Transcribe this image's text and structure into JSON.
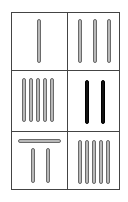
{
  "puzzle": {
    "layout": {
      "rows": 3,
      "cols": 2
    },
    "colors": {
      "border": "#444444",
      "stick_fill": "#b8b8b8",
      "stick_outline": "#6a6a6a",
      "stick_dark": "#111111"
    },
    "cells": [
      {
        "id": "r1c1",
        "vertical_sticks": 1,
        "horizontal_sticks": 0,
        "color": "gray"
      },
      {
        "id": "r1c2",
        "vertical_sticks": 3,
        "horizontal_sticks": 0,
        "color": "gray"
      },
      {
        "id": "r2c1",
        "vertical_sticks": 5,
        "horizontal_sticks": 0,
        "color": "gray"
      },
      {
        "id": "r2c2",
        "vertical_sticks": 2,
        "horizontal_sticks": 0,
        "color": "black"
      },
      {
        "id": "r3c1",
        "vertical_sticks": 2,
        "horizontal_sticks": 1,
        "color": "gray"
      },
      {
        "id": "r3c2",
        "vertical_sticks": 5,
        "horizontal_sticks": 0,
        "color": "gray"
      }
    ]
  }
}
